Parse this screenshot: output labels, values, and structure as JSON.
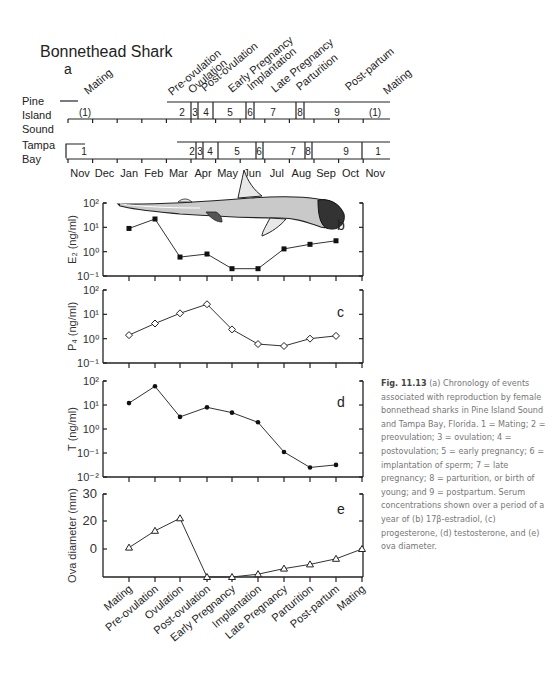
{
  "figure": {
    "title": "Bonnethead Shark",
    "panel_a_label": "a",
    "rows": [
      {
        "label_line1": "Pine",
        "label_line2": "Island",
        "label_line3": "Sound"
      },
      {
        "label_line1": "Tampa",
        "label_line2": "Bay",
        "label_line3": ""
      }
    ],
    "months": [
      "Nov",
      "Dec",
      "Jan",
      "Feb",
      "Mar",
      "Apr",
      "May",
      "Jun",
      "Jul",
      "Aug",
      "Sep",
      "Oct",
      "Nov"
    ],
    "top_event_labels": [
      "Mating",
      "Pre-ovulation",
      "Ovulation",
      "Post-ovulation",
      "Early Pregnancy",
      "Implantation",
      "Late Pregnancy",
      "Parturition",
      "Post-partum",
      "Mating"
    ],
    "pine_island_stages": [
      "(1)",
      "2",
      "3",
      "4",
      "5",
      "6",
      "7",
      "8",
      "9",
      "(1)"
    ],
    "tampa_bay_stages": [
      "1",
      "2",
      "3",
      "4",
      "5",
      "6",
      "7",
      "8",
      "9",
      "1"
    ]
  },
  "caption": {
    "fig_number": "Fig. 11.13",
    "text": "(a) Chronology of events associated with reproduction by female bonnethead sharks in Pine Island Sound and Tampa Bay, Florida. 1 = Mating; 2 = preovulation; 3 = ovulation; 4 = postovulation; 5 = early pregnancy; 6 = implantation of sperm; 7 = late pregnancy; 8 = parturition, or birth of young; and 9 = postpartum. Serum concentrations shown over a period of a year of (b) 17β-estradiol, (c) progesterone, (d) testosterone, and (e) ova diameter."
  },
  "chart_data": [
    {
      "type": "line",
      "panel": "b",
      "title": "",
      "xlabel": "",
      "ylabel": "E2 (ng/ml)",
      "yscale": "log",
      "ylim": [
        0.1,
        100
      ],
      "yticks": [
        "10^-1",
        "10^0",
        "10^1",
        "10^2"
      ],
      "marker": "filled-square",
      "categories": [
        "Mating",
        "Pre-ovulation",
        "Ovulation",
        "Post-ovulation",
        "Early Pregnancy",
        "Implantation",
        "Late Pregnancy",
        "Parturition",
        "Post-partum",
        "Mating"
      ],
      "values": [
        9,
        22,
        0.6,
        0.8,
        0.2,
        0.2,
        1.3,
        2.0,
        2.8,
        null
      ],
      "annotation": "shark illustration"
    },
    {
      "type": "line",
      "panel": "c",
      "ylabel": "P4 (ng/ml)",
      "yscale": "log",
      "ylim": [
        0.1,
        100
      ],
      "yticks": [
        "10^-1",
        "10^0",
        "10^1",
        "10^2"
      ],
      "marker": "open-diamond",
      "categories": [
        "Mating",
        "Pre-ovulation",
        "Ovulation",
        "Post-ovulation",
        "Early Pregnancy",
        "Implantation",
        "Late Pregnancy",
        "Parturition",
        "Post-partum",
        "Mating"
      ],
      "values": [
        1.4,
        4.2,
        11,
        26,
        2.4,
        0.6,
        0.5,
        1.0,
        1.3,
        null
      ]
    },
    {
      "type": "line",
      "panel": "d",
      "ylabel": "T (ng/ml)",
      "yscale": "log",
      "ylim": [
        0.01,
        100
      ],
      "yticks": [
        "10^-2",
        "10^-1",
        "10^0",
        "10^1",
        "10^2"
      ],
      "marker": "filled-circle",
      "categories": [
        "Mating",
        "Pre-ovulation",
        "Ovulation",
        "Post-ovulation",
        "Early Pregnancy",
        "Implantation",
        "Late Pregnancy",
        "Parturition",
        "Post-partum",
        "Mating"
      ],
      "values": [
        12,
        60,
        3.2,
        8,
        4.8,
        1.9,
        0.11,
        0.025,
        0.032,
        null
      ]
    },
    {
      "type": "line",
      "panel": "e",
      "ylabel": "Ova diameter (mm)",
      "ylim": [
        -10,
        30
      ],
      "yticks": [
        "0",
        "20",
        "30"
      ],
      "marker": "open-triangle",
      "categories": [
        "Mating",
        "Pre-ovulation",
        "Ovulation",
        "Post-ovulation",
        "Early Pregnancy",
        "Implantation",
        "Late Pregnancy",
        "Parturition",
        "Post-partum",
        "Mating"
      ],
      "values": [
        1,
        13,
        21,
        -10,
        -10,
        -9,
        -7,
        -5.5,
        -3.5,
        0
      ]
    }
  ]
}
